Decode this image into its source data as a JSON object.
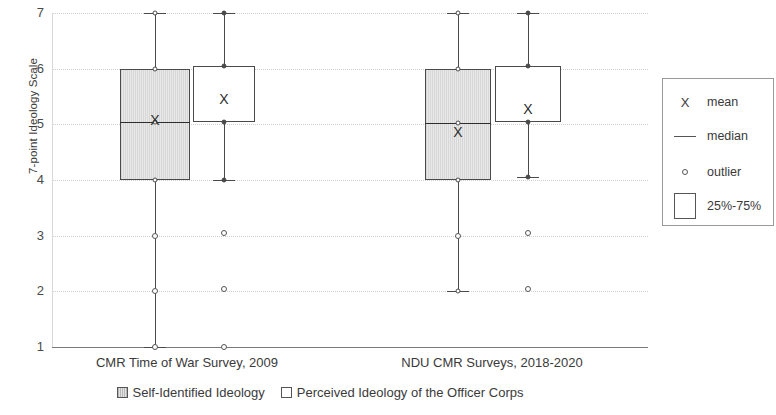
{
  "chart_data": {
    "type": "box",
    "title": "",
    "xlabel": "",
    "ylabel": "7-point Ideology Scale",
    "ylim": [
      1,
      7
    ],
    "yticks": [
      "1",
      "2",
      "3",
      "4",
      "5",
      "6",
      "7"
    ],
    "grid": true,
    "categories": [
      "CMR Time of War Survey, 2009",
      "NDU CMR Surveys, 2018-2020"
    ],
    "series": [
      {
        "name": "Self-Identified Ideology",
        "style": "shaded",
        "boxes": [
          {
            "category": "CMR Time of War Survey, 2009",
            "whisker_low": 1.0,
            "q1": 4.0,
            "median": 5.05,
            "q3": 6.0,
            "whisker_high": 7.0,
            "mean": 5.07,
            "outliers": [
              3.0,
              2.0,
              1.0
            ]
          },
          {
            "category": "NDU CMR Surveys, 2018-2020",
            "whisker_low": 2.0,
            "q1": 4.0,
            "median": 5.03,
            "q3": 6.0,
            "whisker_high": 7.0,
            "mean": 4.87,
            "outliers": [
              3.0
            ]
          }
        ]
      },
      {
        "name": "Perceived Ideology of the Officer Corps",
        "style": "plain",
        "boxes": [
          {
            "category": "CMR Time of War Survey, 2009",
            "whisker_low": 4.0,
            "q1": 5.05,
            "median": 5.05,
            "q3": 6.05,
            "whisker_high": 7.0,
            "mean": 5.45,
            "outliers": [
              3.05,
              2.05,
              1.0
            ]
          },
          {
            "category": "NDU CMR Surveys, 2018-2020",
            "whisker_low": 4.05,
            "q1": 5.05,
            "median": 5.05,
            "q3": 6.05,
            "whisker_high": 7.0,
            "mean": 5.27,
            "outliers": [
              3.05,
              2.05
            ]
          }
        ]
      }
    ]
  },
  "axis": {
    "ylabel": "7-point Ideology Scale",
    "ticks": [
      "7",
      "6",
      "5",
      "4",
      "3",
      "2",
      "1"
    ]
  },
  "categories": {
    "first": "CMR Time of War Survey, 2009",
    "second": "NDU CMR Surveys, 2018-2020"
  },
  "series_legend": {
    "first": "Self-Identified Ideology",
    "second": "Perceived Ideology of the Officer Corps"
  },
  "legend_panel": {
    "mean": "mean",
    "median": "median",
    "outlier": "outlier",
    "quartile": "25%-75%"
  },
  "colors": {
    "box_border": "#4a4a4a",
    "median_line": "#2e2e2e",
    "grid": "#cfcfcf",
    "axis": "#7a7a7a",
    "shaded_fill": "#dedede",
    "plain_fill": "#ffffff",
    "text": "#3a3a3a"
  }
}
